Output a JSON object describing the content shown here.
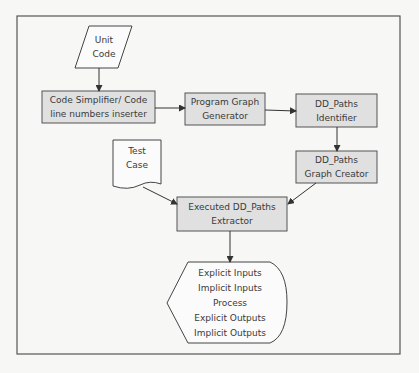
{
  "diagram": {
    "colors": {
      "frame": "#555555",
      "box_fill": "#e0e0e0",
      "box_stroke": "#555555",
      "text": "#3a3a3a",
      "background": "#f7f7f5"
    },
    "nodes": {
      "unit_code": {
        "shape": "parallelogram",
        "lines": [
          "Unit",
          "Code"
        ]
      },
      "code_simplifier": {
        "shape": "rectangle",
        "lines": [
          "Code Simplifier/ Code",
          "line numbers inserter"
        ]
      },
      "program_graph_generator": {
        "shape": "rectangle",
        "lines": [
          "Program Graph",
          "Generator"
        ]
      },
      "dd_paths_identifier": {
        "shape": "rectangle",
        "lines": [
          "DD_Paths",
          "Identifier"
        ]
      },
      "dd_paths_graph_creator": {
        "shape": "rectangle",
        "lines": [
          "DD_Paths",
          "Graph Creator"
        ]
      },
      "test_case": {
        "shape": "document",
        "lines": [
          "Test",
          "Case"
        ]
      },
      "executed_dd_paths_extractor": {
        "shape": "rectangle",
        "lines": [
          "Executed DD_Paths",
          "Extractor"
        ]
      },
      "output_display": {
        "shape": "display",
        "lines": [
          "Explicit Inputs",
          "Implicit Inputs",
          "Process",
          "Explicit Outputs",
          "Implicit Outputs"
        ]
      }
    },
    "edges": [
      {
        "from": "unit_code",
        "to": "code_simplifier"
      },
      {
        "from": "code_simplifier",
        "to": "program_graph_generator"
      },
      {
        "from": "program_graph_generator",
        "to": "dd_paths_identifier"
      },
      {
        "from": "dd_paths_identifier",
        "to": "dd_paths_graph_creator"
      },
      {
        "from": "test_case",
        "to": "executed_dd_paths_extractor"
      },
      {
        "from": "dd_paths_graph_creator",
        "to": "executed_dd_paths_extractor"
      },
      {
        "from": "executed_dd_paths_extractor",
        "to": "output_display"
      }
    ]
  }
}
